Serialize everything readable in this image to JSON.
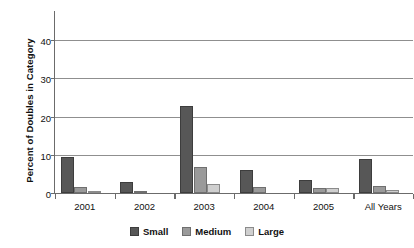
{
  "chart_data": {
    "type": "bar",
    "title": "",
    "subtitle": "",
    "xlabel": "",
    "ylabel": "Percent of Doubles in Category",
    "ylim": [
      0,
      45
    ],
    "yticks": [
      0,
      10,
      20,
      30,
      40
    ],
    "ytick_labels": [
      "0",
      "10",
      "20",
      "30",
      "40"
    ],
    "grid": "horizontal",
    "legend_position": "bottom-center",
    "categories": [
      "2001",
      "2002",
      "2003",
      "2004",
      "2005",
      "All Years"
    ],
    "series": [
      {
        "name": "Small",
        "color": "#575757",
        "values": [
          9.5,
          2.9,
          22.8,
          6.1,
          3.3,
          8.8
        ]
      },
      {
        "name": "Medium",
        "color": "#9a9a9a",
        "values": [
          1.6,
          0.3,
          6.8,
          1.5,
          1.2,
          1.8
        ]
      },
      {
        "name": "Large",
        "color": "#cfcfcf",
        "values": [
          0.4,
          0.0,
          2.4,
          0.0,
          1.2,
          0.7
        ]
      }
    ]
  },
  "legend": {
    "items": [
      {
        "label": "Small"
      },
      {
        "label": "Medium"
      },
      {
        "label": "Large"
      }
    ]
  }
}
